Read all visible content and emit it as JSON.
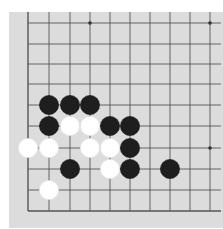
{
  "game": "Go",
  "board": {
    "background": "#dcdcdc",
    "line_color": "#555555",
    "columns_visible": 10,
    "rows_visible": 10,
    "x_lines": [
      28,
      49,
      70,
      90,
      110,
      130,
      150,
      170,
      190,
      210
    ],
    "y_lines": [
      23,
      44,
      64,
      84,
      105,
      126,
      148,
      169,
      190,
      211
    ],
    "edges": {
      "left": true,
      "bottom": true,
      "top": false,
      "right": false
    },
    "star_points": [
      [
        3,
        0
      ],
      [
        9,
        0
      ],
      [
        3,
        6
      ],
      [
        9,
        6
      ]
    ]
  },
  "stones": [
    {
      "color": "black",
      "col": 1,
      "row": 4
    },
    {
      "color": "black",
      "col": 2,
      "row": 4
    },
    {
      "color": "black",
      "col": 3,
      "row": 4
    },
    {
      "color": "black",
      "col": 1,
      "row": 5
    },
    {
      "color": "white",
      "col": 2,
      "row": 5
    },
    {
      "color": "white",
      "col": 3,
      "row": 5
    },
    {
      "color": "black",
      "col": 4,
      "row": 5
    },
    {
      "color": "black",
      "col": 5,
      "row": 5
    },
    {
      "color": "white",
      "col": 0,
      "row": 6
    },
    {
      "color": "white",
      "col": 1,
      "row": 6
    },
    {
      "color": "white",
      "col": 3,
      "row": 6
    },
    {
      "color": "white",
      "col": 4,
      "row": 6
    },
    {
      "color": "black",
      "col": 5,
      "row": 6
    },
    {
      "color": "black",
      "col": 2,
      "row": 7
    },
    {
      "color": "white",
      "col": 4,
      "row": 7
    },
    {
      "color": "black",
      "col": 5,
      "row": 7
    },
    {
      "color": "black",
      "col": 7,
      "row": 7
    },
    {
      "color": "white",
      "col": 1,
      "row": 8
    }
  ],
  "colors": {
    "black_stone": "#1e1e1e",
    "white_stone": "#ffffff"
  }
}
